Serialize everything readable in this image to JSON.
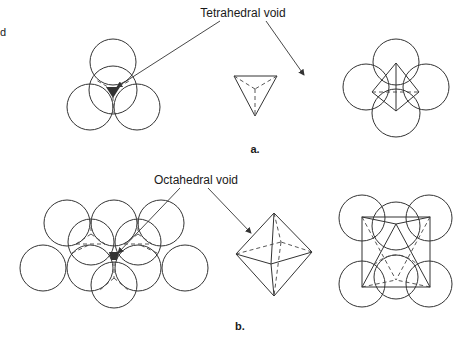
{
  "figure": {
    "corner_fragment": "d",
    "panel_a": {
      "label": "a.",
      "callout": "Tetrahedral void",
      "views": [
        "close-packed-spheres-with-tetrahedral-void",
        "tetrahedron",
        "tetrahedron-within-four-spheres"
      ]
    },
    "panel_b": {
      "label": "b.",
      "callout": "Octahedral void",
      "views": [
        "close-packed-layers-with-octahedral-void",
        "octahedron",
        "octahedron-within-six-spheres"
      ]
    },
    "colors": {
      "line": "#333333",
      "void_fill": "#333333",
      "background": "#ffffff"
    }
  }
}
